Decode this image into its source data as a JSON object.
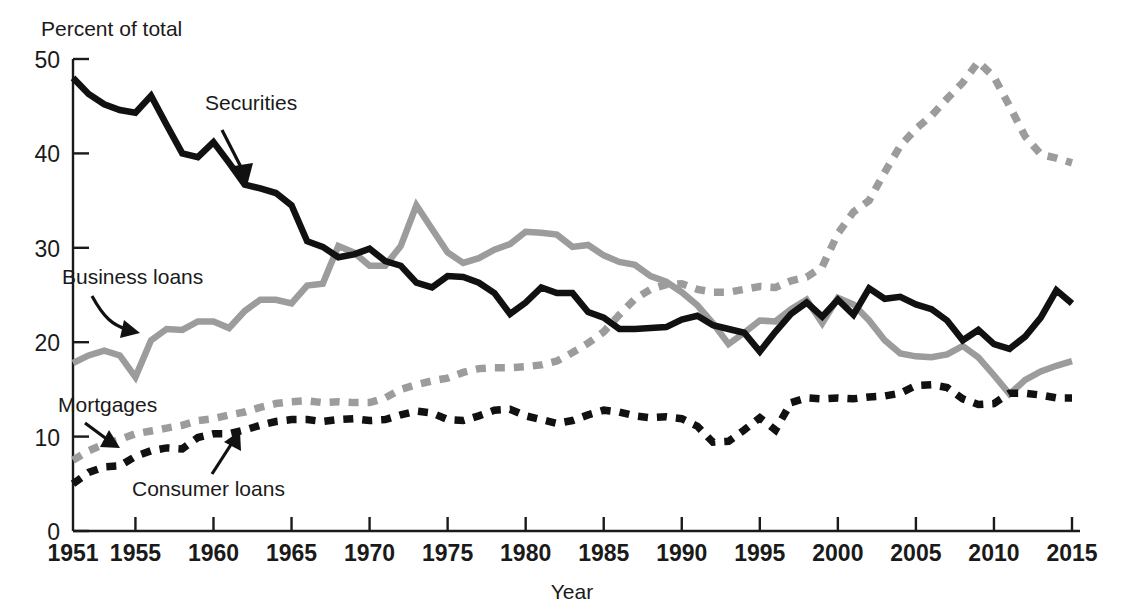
{
  "figure": {
    "y_axis_title": "Percent of total",
    "x_axis_title": "Year",
    "background_color": "#ffffff"
  },
  "axes": {
    "y_ticks": [
      "0",
      "10",
      "20",
      "30",
      "40",
      "50"
    ],
    "x_ticks": [
      "1951",
      "1955",
      "1960",
      "1965",
      "1970",
      "1975",
      "1980",
      "1985",
      "1990",
      "1995",
      "2000",
      "2005",
      "2010",
      "2015"
    ]
  },
  "annotations": [
    {
      "name": "securities",
      "label": "Securities",
      "x": 205,
      "y": 110
    },
    {
      "name": "business-loans",
      "label": "Business loans",
      "x": 62,
      "y": 284
    },
    {
      "name": "mortgages",
      "label": "Mortgages",
      "x": 58,
      "y": 412
    },
    {
      "name": "consumer-loans",
      "label": "Consumer loans",
      "x": 132,
      "y": 496
    }
  ],
  "chart_data": {
    "type": "line",
    "title": "",
    "subtitle": "",
    "xlabel": "Year",
    "ylabel": "Percent of total",
    "ylim": [
      0,
      50
    ],
    "xlim": [
      1951,
      2015
    ],
    "grid": false,
    "legend": "inline-annotations",
    "x": [
      1951,
      1952,
      1953,
      1954,
      1955,
      1956,
      1957,
      1958,
      1959,
      1960,
      1961,
      1962,
      1963,
      1964,
      1965,
      1966,
      1967,
      1968,
      1969,
      1970,
      1971,
      1972,
      1973,
      1974,
      1975,
      1976,
      1977,
      1978,
      1979,
      1980,
      1981,
      1982,
      1983,
      1984,
      1985,
      1986,
      1987,
      1988,
      1989,
      1990,
      1991,
      1992,
      1993,
      1994,
      1995,
      1996,
      1997,
      1998,
      1999,
      2000,
      2001,
      2002,
      2003,
      2004,
      2005,
      2006,
      2007,
      2008,
      2009,
      2010,
      2011,
      2012,
      2013,
      2014,
      2015
    ],
    "series": [
      {
        "name": "Securities",
        "color": "#111111",
        "style": "solid",
        "width": 6.5,
        "values": [
          48.0,
          46.3,
          45.2,
          44.6,
          44.3,
          46.1,
          43.0,
          40.0,
          39.6,
          41.2,
          39.0,
          36.7,
          36.3,
          35.8,
          34.5,
          30.7,
          30.1,
          29.0,
          29.3,
          29.9,
          28.6,
          28.1,
          26.3,
          25.8,
          27.0,
          26.9,
          26.3,
          25.2,
          23.0,
          24.2,
          25.8,
          25.2,
          25.2,
          23.2,
          22.6,
          21.4,
          21.4,
          21.5,
          21.6,
          22.4,
          22.8,
          21.8,
          21.4,
          21.0,
          19.0,
          21.1,
          23.0,
          24.2,
          22.7,
          24.5,
          22.9,
          25.7,
          24.6,
          24.8,
          24.0,
          23.5,
          22.3,
          20.2,
          21.3,
          19.8,
          19.3,
          20.6,
          22.6,
          25.5,
          24.1
        ]
      },
      {
        "name": "Business loans",
        "color": "#9c9c9c",
        "style": "solid",
        "width": 6.5,
        "values": [
          17.8,
          18.6,
          19.1,
          18.6,
          16.3,
          20.2,
          21.4,
          21.3,
          22.2,
          22.2,
          21.5,
          23.3,
          24.5,
          24.5,
          24.1,
          26.0,
          26.2,
          30.2,
          29.5,
          28.1,
          28.1,
          30.2,
          34.5,
          32.0,
          29.5,
          28.4,
          28.9,
          29.8,
          30.4,
          31.7,
          31.6,
          31.4,
          30.1,
          30.3,
          29.2,
          28.5,
          28.2,
          27.0,
          26.4,
          25.3,
          23.9,
          22.0,
          19.8,
          21.0,
          22.3,
          22.2,
          23.5,
          24.5,
          22.0,
          24.7,
          24.0,
          22.3,
          20.2,
          18.8,
          18.5,
          18.4,
          18.7,
          19.6,
          18.4,
          16.5,
          14.5,
          16.0,
          16.9,
          17.5,
          18.0
        ]
      },
      {
        "name": "Mortgages",
        "color": "#9c9c9c",
        "style": "dashed",
        "width": 7.5,
        "dash": "10,9",
        "values": [
          7.5,
          8.5,
          9.2,
          9.7,
          10.3,
          10.6,
          10.9,
          11.2,
          11.7,
          11.9,
          12.3,
          12.6,
          13.1,
          13.5,
          13.7,
          13.8,
          13.6,
          13.7,
          13.6,
          13.6,
          14.1,
          15.0,
          15.5,
          15.9,
          16.2,
          16.8,
          17.2,
          17.3,
          17.3,
          17.4,
          17.6,
          18.0,
          18.9,
          19.9,
          21.1,
          22.9,
          24.6,
          25.6,
          26.1,
          26.2,
          25.6,
          25.3,
          25.3,
          25.6,
          25.9,
          25.8,
          26.5,
          26.9,
          28.0,
          31.5,
          33.8,
          35.0,
          38.0,
          40.8,
          42.6,
          44.0,
          45.8,
          47.5,
          49.7,
          48.1,
          45.0,
          41.8,
          39.9,
          39.5,
          39.0
        ]
      },
      {
        "name": "Consumer loans",
        "color": "#111111",
        "style": "dashed",
        "width": 7.5,
        "dash": "10,9",
        "values": [
          5.0,
          6.2,
          6.8,
          6.9,
          7.9,
          8.5,
          8.8,
          8.7,
          9.9,
          10.3,
          10.3,
          10.7,
          11.2,
          11.6,
          11.8,
          11.8,
          11.6,
          11.8,
          11.9,
          11.7,
          11.8,
          12.3,
          12.7,
          12.5,
          11.8,
          11.7,
          12.2,
          12.8,
          12.9,
          12.2,
          11.8,
          11.4,
          11.7,
          12.3,
          12.8,
          12.6,
          12.2,
          12.0,
          12.1,
          11.9,
          11.1,
          9.4,
          9.5,
          10.7,
          12.0,
          10.7,
          13.6,
          14.1,
          14.0,
          14.1,
          14.0,
          14.2,
          14.3,
          14.6,
          15.4,
          15.5,
          15.2,
          14.0,
          13.4,
          13.5,
          14.6,
          14.6,
          14.4,
          14.1,
          14.1
        ]
      }
    ]
  },
  "geometry": {
    "plot_left": 73,
    "plot_right": 1072,
    "plot_top": 59,
    "plot_bottom": 531
  }
}
